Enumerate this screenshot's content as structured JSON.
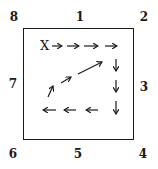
{
  "labels": {
    "n1": "1",
    "n2": "2",
    "n3": "3",
    "n4": "4",
    "n5": "5",
    "n6": "6",
    "n7": "7",
    "n8": "8"
  },
  "start_marker": "X",
  "path_description": "Spiral path starting at X moving right four steps, then down three steps, then left three steps, then up-right diagonally back toward the top-right",
  "colors": {
    "ink": "#1a1a1a",
    "background": "#ffffff"
  }
}
